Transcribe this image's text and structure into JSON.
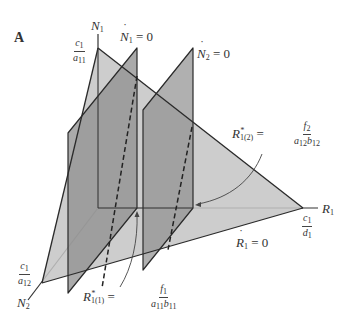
{
  "panel_label": "A",
  "axes": {
    "n1": {
      "name": "N",
      "sub": "1"
    },
    "n2": {
      "name": "N",
      "sub": "2"
    },
    "r1": {
      "name": "R",
      "sub": "1"
    }
  },
  "intercepts": {
    "n1": {
      "num_var": "c",
      "num_sub": "1",
      "den_var": "a",
      "den_sub": "11"
    },
    "n2": {
      "num_var": "c",
      "num_sub": "1",
      "den_var": "a",
      "den_sub": "12"
    },
    "r1": {
      "num_var": "c",
      "num_sub": "1",
      "den_var": "d",
      "den_sub": "1"
    }
  },
  "isoclines": {
    "n1_dot": {
      "var": "N",
      "sub": "1",
      "eq": " = 0"
    },
    "n2_dot": {
      "var": "N",
      "sub": "2",
      "eq": " = 0"
    },
    "r1_dot": {
      "var": "R",
      "sub": "1",
      "eq": " = 0"
    }
  },
  "annotations": {
    "r_star_1": {
      "var": "R",
      "sup": "*",
      "sub": "1(1)",
      "eq": " = ",
      "num_var": "f",
      "num_sub": "1",
      "den": "a",
      "den_sub1": "11",
      "den2": "b",
      "den_sub2": "11"
    },
    "r_star_2": {
      "var": "R",
      "sup": "*",
      "sub": "1(2)",
      "eq": " = ",
      "num_var": "f",
      "num_sub": "2",
      "den": "a",
      "den_sub1": "12",
      "den2": "b",
      "den_sub2": "12"
    }
  },
  "colors": {
    "light_plane": "#c4c4c4",
    "mid_plane": "#a9a9a9",
    "dark_plane": "#8e8e8e",
    "edge": "#2a2a2a"
  }
}
